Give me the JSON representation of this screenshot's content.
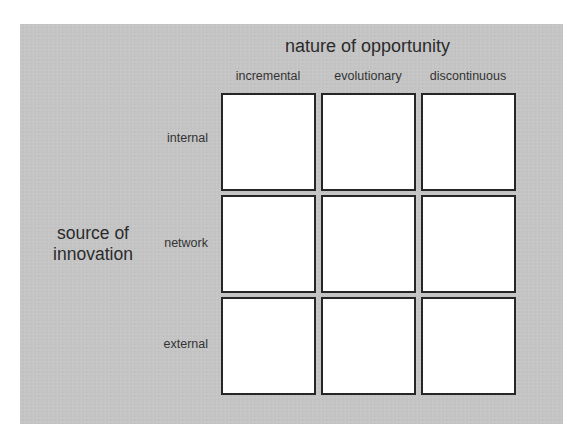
{
  "diagram": {
    "title": "nature of opportunity",
    "y_axis_label_line1": "source of",
    "y_axis_label_line2": "innovation",
    "columns": [
      {
        "label": "incremental"
      },
      {
        "label": "evolutionary"
      },
      {
        "label": "discontinuous"
      }
    ],
    "rows": [
      {
        "label": "internal"
      },
      {
        "label": "network"
      },
      {
        "label": "external"
      }
    ],
    "cells": [
      [
        "",
        "",
        ""
      ],
      [
        "",
        "",
        ""
      ],
      [
        "",
        "",
        ""
      ]
    ],
    "colors": {
      "panel_background": "#c5c5c5",
      "cell_background": "#ffffff",
      "cell_border": "#262626",
      "text": "#2b2b2b"
    }
  }
}
